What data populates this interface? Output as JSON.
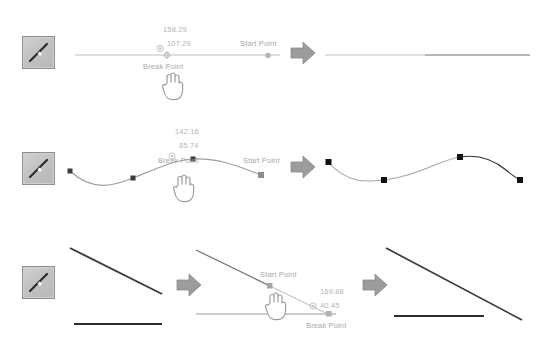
{
  "app": {
    "title": "Break Line Tool Demonstration",
    "background": "#ffffff"
  },
  "colors": {
    "line_light": "#bdbdbd",
    "line_dark": "#4a4a4a",
    "node_dark": "#111111",
    "label_text": "#a8a8a8",
    "arrow_fill": "#9c9c9c",
    "button_face": "#c6c6c6",
    "button_border": "#8e8e8e"
  },
  "labels": {
    "start_point": "Start Point",
    "break_point": "Break Point"
  },
  "icons": {
    "tool": "break-line-tool-icon",
    "arrow": "arrow-right-icon",
    "cursor": "hand-pointer-cursor-icon",
    "break_marker": "break-point-target-icon",
    "node_round": "round-node-icon",
    "node_square": "square-node-icon"
  },
  "rows": [
    {
      "id": "straight-line",
      "tool_label": "Break line tool",
      "before": {
        "start_point_label": "Start Point",
        "break_point_label": "Break Point",
        "measurements": [
          "158.29",
          "107.29"
        ]
      },
      "after": {
        "description": "single straight horizontal line"
      }
    },
    {
      "id": "spline-curve",
      "tool_label": "Break line tool",
      "before": {
        "start_point_label": "Start Point",
        "break_point_label": "Break Point",
        "measurements": [
          "142.16",
          "85.74"
        ]
      },
      "after": {
        "description": "s-curve with four square nodes"
      }
    },
    {
      "id": "diagonal-extend",
      "tool_label": "Break line tool",
      "before": {
        "description": "diagonal line above horizontal line"
      },
      "middle": {
        "start_point_label": "Start Point",
        "break_point_label": "Break Point",
        "measurements": [
          "169.88",
          "40.45"
        ]
      },
      "after": {
        "description": "extended diagonal line above horizontal line"
      }
    }
  ]
}
